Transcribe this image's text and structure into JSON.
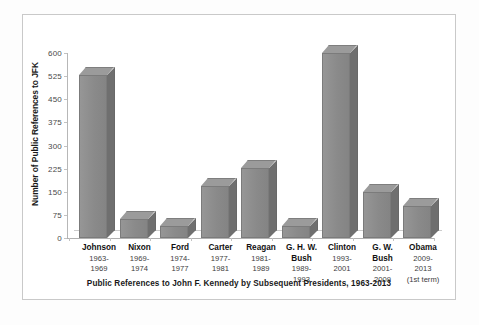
{
  "figure": {
    "caption": "Public References to John F. Kennedy by Subsequent Presidents, 1963-2013"
  },
  "chart_data": {
    "type": "bar",
    "title": "",
    "subtitle": "",
    "xlabel": "",
    "ylabel": "Number of Public References to JFK",
    "ylim": [
      0,
      600
    ],
    "yticks": [
      0,
      75,
      150,
      225,
      300,
      375,
      450,
      525,
      600
    ],
    "grid": false,
    "legend": false,
    "style": "3d-column",
    "bar_color": "#8c8c8c",
    "categories": [
      "Johnson",
      "Nixon",
      "Ford",
      "Carter",
      "Reagan",
      "G. H. W. Bush",
      "Clinton",
      "G. W. Bush",
      "Obama"
    ],
    "category_terms": [
      "1963-1969",
      "1969-1974",
      "1974-1977",
      "1977-1981",
      "1981-1989",
      "1989-1993",
      "1993-2001",
      "2001-2009",
      "2009-2013 (1st term)"
    ],
    "values": [
      530,
      62,
      38,
      168,
      228,
      40,
      600,
      148,
      105
    ],
    "annotations": []
  },
  "axis": {
    "y_title": "Number of Public References to JFK",
    "y_tick_labels": [
      "600",
      "525",
      "450",
      "375",
      "300",
      "225",
      "150",
      "75",
      "0"
    ]
  },
  "categories": [
    {
      "name": "Johnson",
      "line1": "1963-",
      "line2": "1969",
      "line3": ""
    },
    {
      "name": "Nixon",
      "line1": "1969-",
      "line2": "1974",
      "line3": ""
    },
    {
      "name": "Ford",
      "line1": "1974-",
      "line2": "1977",
      "line3": ""
    },
    {
      "name": "Carter",
      "line1": "1977-",
      "line2": "1981",
      "line3": ""
    },
    {
      "name": "Reagan",
      "line1": "1981-",
      "line2": "1989",
      "line3": ""
    },
    {
      "name": "G. H. W.",
      "line1": "Bush",
      "line2": "1989-",
      "line3": "1993"
    },
    {
      "name": "Clinton",
      "line1": "1993-",
      "line2": "2001",
      "line3": ""
    },
    {
      "name": "G. W.",
      "line1": "Bush",
      "line2": "2001-",
      "line3": "2009"
    },
    {
      "name": "Obama",
      "line1": "2009-",
      "line2": "2013",
      "line3": "(1st term)"
    }
  ]
}
